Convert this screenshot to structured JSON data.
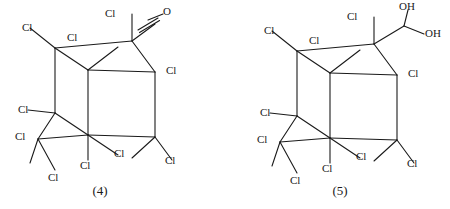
{
  "figure": {
    "background_color": "#ffffff",
    "line_color": "#1a1a1a",
    "text_color": "#1a1a1a"
  },
  "chart_data": {
    "type": "diagram",
    "title": "",
    "subtitle": "",
    "xlabel": "",
    "ylabel": "",
    "structures": [
      {
        "id": "4",
        "caption": "(4)",
        "functional_group": "C=O",
        "substituent_counts": {
          "Cl": 8,
          "O": 1,
          "OH": 0
        }
      },
      {
        "id": "5",
        "caption": "(5)",
        "functional_group": "C(OH)2",
        "substituent_counts": {
          "Cl": 8,
          "O": 0,
          "OH": 2
        }
      }
    ]
  },
  "structure4": {
    "caption": "(4)",
    "caption_pos": {
      "x": 70,
      "y": 183
    },
    "bonds": [
      [
        55,
        48,
        88,
        70
      ],
      [
        55,
        48,
        55,
        113
      ],
      [
        55,
        48,
        132,
        41
      ],
      [
        132,
        41,
        155,
        72
      ],
      [
        88,
        70,
        155,
        72
      ],
      [
        88,
        70,
        88,
        135
      ],
      [
        155,
        72,
        155,
        137
      ],
      [
        55,
        113,
        88,
        135
      ],
      [
        55,
        113,
        38,
        139
      ],
      [
        88,
        135,
        155,
        137
      ],
      [
        88,
        135,
        88,
        160
      ],
      [
        155,
        137,
        132,
        158
      ],
      [
        38,
        139,
        88,
        135
      ],
      [
        38,
        139,
        30,
        163
      ],
      [
        38,
        139,
        55,
        170
      ],
      [
        132,
        41,
        132,
        14
      ],
      [
        155,
        137,
        172,
        160
      ],
      [
        88,
        70,
        118,
        47
      ],
      [
        88,
        135,
        118,
        155
      ],
      [
        55,
        48,
        30,
        28
      ],
      [
        55,
        113,
        28,
        110
      ],
      [
        132,
        41,
        155,
        24
      ],
      [
        148,
        20,
        163,
        14
      ]
    ],
    "double_bond": {
      "x1": 138,
      "y1": 30,
      "x2": 158,
      "y2": 18,
      "offset": 3
    },
    "labels": [
      {
        "text": "Cl",
        "x": 22,
        "y": 22,
        "name": "cl-label-upper-left"
      },
      {
        "text": "Cl",
        "x": 67,
        "y": 32,
        "name": "cl-label-top-inner-left"
      },
      {
        "text": "Cl",
        "x": 105,
        "y": 8,
        "name": "cl-label-top"
      },
      {
        "text": "O",
        "x": 163,
        "y": 6,
        "name": "o-label-carbonyl"
      },
      {
        "text": "Cl",
        "x": 166,
        "y": 65,
        "name": "cl-label-right"
      },
      {
        "text": "Cl",
        "x": 18,
        "y": 104,
        "name": "cl-label-mid-left"
      },
      {
        "text": "Cl",
        "x": 15,
        "y": 131,
        "name": "cl-label-lower-left"
      },
      {
        "text": "Cl",
        "x": 48,
        "y": 172,
        "name": "cl-label-bottom-left"
      },
      {
        "text": "Cl",
        "x": 80,
        "y": 160,
        "name": "cl-label-bottom-center"
      },
      {
        "text": "Cl",
        "x": 114,
        "y": 148,
        "name": "cl-label-bottom-inner"
      },
      {
        "text": "Cl",
        "x": 165,
        "y": 155,
        "name": "cl-label-bottom-right"
      }
    ]
  },
  "structure5": {
    "caption": "(5)",
    "caption_pos": {
      "x": 310,
      "y": 183
    },
    "bonds": [
      [
        297,
        51,
        330,
        73
      ],
      [
        297,
        51,
        297,
        116
      ],
      [
        297,
        51,
        374,
        44
      ],
      [
        374,
        44,
        397,
        75
      ],
      [
        330,
        73,
        397,
        75
      ],
      [
        330,
        73,
        330,
        138
      ],
      [
        397,
        75,
        397,
        140
      ],
      [
        297,
        116,
        330,
        138
      ],
      [
        297,
        116,
        280,
        142
      ],
      [
        330,
        138,
        397,
        140
      ],
      [
        330,
        138,
        330,
        163
      ],
      [
        397,
        140,
        374,
        161
      ],
      [
        280,
        142,
        330,
        138
      ],
      [
        280,
        142,
        272,
        166
      ],
      [
        280,
        142,
        297,
        173
      ],
      [
        374,
        44,
        374,
        17
      ],
      [
        397,
        140,
        414,
        163
      ],
      [
        330,
        73,
        360,
        50
      ],
      [
        330,
        138,
        360,
        158
      ],
      [
        297,
        51,
        272,
        31
      ],
      [
        297,
        116,
        270,
        113
      ],
      [
        374,
        44,
        404,
        26
      ],
      [
        404,
        26,
        408,
        10
      ],
      [
        404,
        26,
        424,
        34
      ]
    ],
    "labels": [
      {
        "text": "Cl",
        "x": 264,
        "y": 25,
        "name": "cl-label-upper-left"
      },
      {
        "text": "Cl",
        "x": 309,
        "y": 35,
        "name": "cl-label-top-inner-left"
      },
      {
        "text": "Cl",
        "x": 347,
        "y": 11,
        "name": "cl-label-top"
      },
      {
        "text": "OH",
        "x": 399,
        "y": 1,
        "name": "oh-label-upper"
      },
      {
        "text": "OH",
        "x": 425,
        "y": 28,
        "name": "oh-label-lower"
      },
      {
        "text": "Cl",
        "x": 408,
        "y": 68,
        "name": "cl-label-right"
      },
      {
        "text": "Cl",
        "x": 260,
        "y": 107,
        "name": "cl-label-mid-left"
      },
      {
        "text": "Cl",
        "x": 257,
        "y": 134,
        "name": "cl-label-lower-left"
      },
      {
        "text": "Cl",
        "x": 290,
        "y": 175,
        "name": "cl-label-bottom-left"
      },
      {
        "text": "Cl",
        "x": 322,
        "y": 163,
        "name": "cl-label-bottom-center"
      },
      {
        "text": "Cl",
        "x": 356,
        "y": 151,
        "name": "cl-label-bottom-inner"
      },
      {
        "text": "Cl",
        "x": 407,
        "y": 158,
        "name": "cl-label-bottom-right"
      }
    ]
  }
}
